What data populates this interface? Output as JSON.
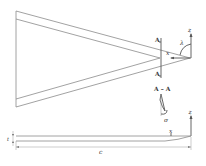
{
  "figure": {
    "planform_view": {
      "section_label_top": "A",
      "section_label_bottom": "A",
      "axis_z_label": "z",
      "axis_x_label": "x",
      "sweep_angle_label": "λ"
    },
    "section_view": {
      "title": "A – A",
      "twist_label": "σ"
    },
    "side_view": {
      "axis_z_label": "z",
      "axis_x_label": "x",
      "thickness_label": "t",
      "chord_label": "c"
    }
  }
}
